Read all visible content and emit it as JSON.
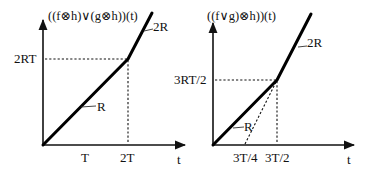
{
  "panels": [
    {
      "title": "((f⊗h)∨(g⊗h))(t)",
      "x_axis_label": "t",
      "x_ticks": [
        "T",
        "2T"
      ],
      "y_ticks": [
        "2RT"
      ],
      "segments": [
        {
          "label": "R",
          "slope": "R",
          "from": "0",
          "to": "2T"
        },
        {
          "label": "2R",
          "slope": "2R",
          "from": "2T"
        }
      ]
    },
    {
      "title": "((f∨g)⊗h))(t)",
      "x_axis_label": "t",
      "x_ticks": [
        "3T/4",
        "3T/2"
      ],
      "y_ticks": [
        "3RT/2"
      ],
      "segments": [
        {
          "label": "R",
          "slope": "R",
          "from": "0",
          "to": "3T/2"
        },
        {
          "label": "2R",
          "slope": "2R",
          "from": "3T/2"
        }
      ],
      "dashed_helper": {
        "from": "3T/4",
        "to": "3T/2"
      }
    }
  ],
  "colors": {
    "ink": "#000000",
    "background": "#ffffff"
  }
}
